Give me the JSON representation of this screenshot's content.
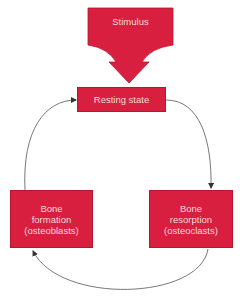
{
  "diagram": {
    "stimulus": {
      "label": "Stimulus"
    },
    "nodes": [
      {
        "id": "resting",
        "label": "Resting state"
      },
      {
        "id": "resorption",
        "lines": [
          "Bone",
          "resorption",
          "(osteoclasts)"
        ]
      },
      {
        "id": "formation",
        "lines": [
          "Bone",
          "formation",
          "(osteoblasts)"
        ]
      }
    ],
    "edges": [
      {
        "from": "stimulus",
        "to": "resting"
      },
      {
        "from": "resting",
        "to": "resorption"
      },
      {
        "from": "resorption",
        "to": "formation"
      },
      {
        "from": "formation",
        "to": "resting"
      }
    ],
    "colors": {
      "box_fill": "#d81f3f",
      "box_text": "#f6dadd",
      "arrow": "#555555"
    }
  }
}
